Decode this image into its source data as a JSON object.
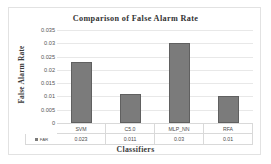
{
  "chart_data": {
    "type": "bar",
    "title": "Comparison  of False Alarm  Rate",
    "xlabel": "Classifiers",
    "ylabel": "False Alarm Rate",
    "categories": [
      "SVM",
      "C5.0",
      "MLP_NN",
      "RFA"
    ],
    "values": [
      0.023,
      0.011,
      0.03,
      0.01
    ],
    "value_labels": [
      "0.023",
      "0.011",
      "0.03",
      "0.01"
    ],
    "series": [
      {
        "name": "FAR",
        "values": [
          0.023,
          0.011,
          0.03,
          0.01
        ],
        "color": "#7b7b7b"
      }
    ],
    "ylim": [
      0,
      0.035
    ],
    "ytick_values": [
      0.035,
      0.03,
      0.025,
      0.02,
      0.015,
      0.01,
      0.005,
      0
    ],
    "ytick_labels": [
      "0.035",
      "0.03",
      "0.025",
      "0.02",
      "0.015",
      "0.01",
      "0.005",
      "0"
    ],
    "grid": true,
    "grid_axis": "y",
    "legend": {
      "position": "bottom-table",
      "entries": [
        {
          "label": "FAR",
          "marker": "square-swatch",
          "color": "#7b7b7b"
        }
      ]
    },
    "data_table": {
      "visible": true,
      "header_row": [
        "SVM",
        "C5.0",
        "MLP_NN",
        "RFA"
      ],
      "rows": [
        {
          "label": "FAR",
          "cells": [
            "0.023",
            "0.011",
            "0.03",
            "0.01"
          ]
        }
      ]
    },
    "colors": {
      "bar_fill": "#7b7b7b",
      "bar_border": "#606060",
      "gridline": "#e8e8e8",
      "frame": "#e2e2e2",
      "background": "#ffffff",
      "text": "#3a3a3a"
    }
  }
}
